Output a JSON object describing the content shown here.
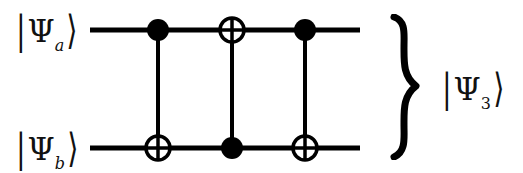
{
  "figure": {
    "width": 523,
    "height": 173,
    "background_color": "#ffffff",
    "ink_color": "#000000"
  },
  "labels": {
    "input_top": {
      "text": "|Ψa⟩",
      "bar": "|",
      "psi": "Ψ",
      "subscript": "a",
      "angle": "⟩"
    },
    "input_bottom": {
      "text": "|Ψb⟩",
      "bar": "|",
      "psi": "Ψ",
      "subscript": "b",
      "angle": "⟩"
    },
    "output_joint": {
      "text": "|Ψ3⟩",
      "bar": "|",
      "psi": "Ψ",
      "subscript": "3",
      "angle": "⟩"
    },
    "brace": "}"
  },
  "circuit": {
    "wires": [
      {
        "name": "wire-top",
        "label_ref": "input_top",
        "y": 30,
        "x_start": 90,
        "x_end": 360
      },
      {
        "name": "wire-bottom",
        "label_ref": "input_bottom",
        "y": 148,
        "x_start": 90,
        "x_end": 360
      }
    ],
    "wire_thickness": 5,
    "gate_columns": [
      {
        "name": "cnot-1",
        "x": 158,
        "top_symbol": "control-dot",
        "bottom_symbol": "xor-target",
        "description": "CNOT with control on top wire, target on bottom wire"
      },
      {
        "name": "cnot-2",
        "x": 232,
        "top_symbol": "xor-target",
        "bottom_symbol": "control-dot",
        "description": "CNOT with control on bottom wire, target on top wire"
      },
      {
        "name": "cnot-3",
        "x": 305,
        "top_symbol": "control-dot",
        "bottom_symbol": "xor-target",
        "description": "CNOT with control on top wire, target on bottom wire"
      }
    ],
    "control_dot_radius": 11,
    "target_circle_radius": 12,
    "target_stroke_width": 3.5,
    "connector_width": 4
  }
}
